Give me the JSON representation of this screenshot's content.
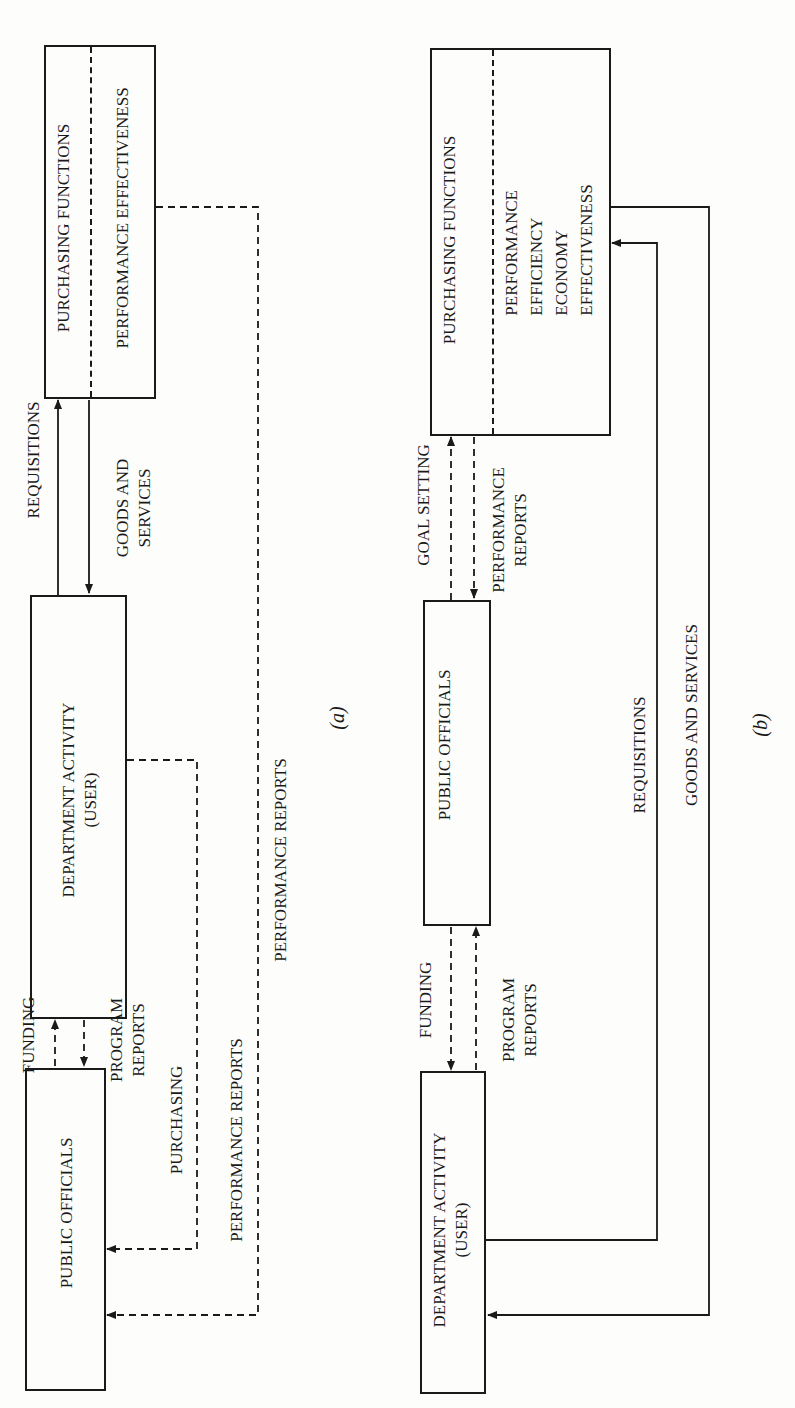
{
  "orientation": "rotated-90-ccw",
  "colors": {
    "ink": "#1a1a1a",
    "paper": "#fdfdfc"
  },
  "diagram_a": {
    "caption": "(a)",
    "boxes": {
      "purchasing": {
        "title": "PURCHASING FUNCTIONS",
        "subtitle": "PERFORMANCE EFFECTIVENESS"
      },
      "department": {
        "line1": "DEPARTMENT ACTIVITY",
        "line2": "(USER)"
      },
      "officials": {
        "title": "PUBLIC OFFICIALS"
      }
    },
    "flows": {
      "requisitions": "REQUISITIONS",
      "goods_line1": "GOODS AND",
      "goods_line2": "SERVICES",
      "funding": "FUNDING",
      "program_line1": "PROGRAM",
      "program_line2": "REPORTS",
      "purchasing": "PURCHASING",
      "performance_reports_1": "PERFORMANCE REPORTS",
      "performance_reports_2": "PERFORMANCE REPORTS"
    }
  },
  "diagram_b": {
    "caption": "(b)",
    "boxes": {
      "purchasing": {
        "title": "PURCHASING FUNCTIONS",
        "criteria": [
          "PERFORMANCE",
          "EFFICIENCY",
          "ECONOMY",
          "EFFECTIVENESS"
        ]
      },
      "officials": {
        "title": "PUBLIC OFFICIALS"
      },
      "department": {
        "line1": "DEPARTMENT ACTIVITY",
        "line2": "(USER)"
      }
    },
    "flows": {
      "goal_setting": "GOAL SETTING",
      "perf_line1": "PERFORMANCE",
      "perf_line2": "REPORTS",
      "funding": "FUNDING",
      "program_line1": "PROGRAM",
      "program_line2": "REPORTS",
      "requisitions": "REQUISITIONS",
      "goods_and_services": "GOODS AND SERVICES"
    }
  }
}
